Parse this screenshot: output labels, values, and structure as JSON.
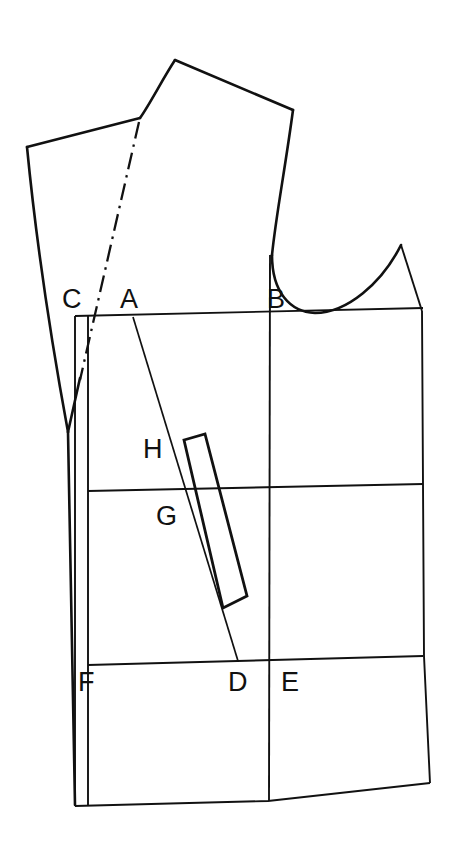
{
  "diagram": {
    "type": "technical-line-drawing",
    "background_color": "#ffffff",
    "line_color": "#111111",
    "canvas": {
      "width": 458,
      "height": 843
    },
    "labels": [
      {
        "id": "C",
        "text": "C",
        "x": 62,
        "y": 308,
        "meaning": "center-back-neck-point"
      },
      {
        "id": "A",
        "text": "A",
        "x": 120,
        "y": 308,
        "meaning": "shoulder-dart-apex-point"
      },
      {
        "id": "B",
        "text": "B",
        "x": 267,
        "y": 308,
        "meaning": "armhole-underarm-point"
      },
      {
        "id": "H",
        "text": "H",
        "x": 143,
        "y": 458,
        "meaning": "dart-upper-point"
      },
      {
        "id": "G",
        "text": "G",
        "x": 156,
        "y": 525,
        "meaning": "waist-line-point"
      },
      {
        "id": "F",
        "text": "F",
        "x": 78,
        "y": 691,
        "meaning": "center-front-hip-point"
      },
      {
        "id": "D",
        "text": "D",
        "x": 228,
        "y": 691,
        "meaning": "dart-lower-point"
      },
      {
        "id": "E",
        "text": "E",
        "x": 281,
        "y": 691,
        "meaning": "side-hip-point"
      }
    ],
    "geometry": {
      "shoulder_left_point": {
        "x": 27,
        "y": 147
      },
      "neck_apex_point": {
        "x": 175,
        "y": 60
      },
      "neck_base_point": {
        "x": 140,
        "y": 118
      },
      "shoulder_right_point": {
        "x": 293,
        "y": 110
      },
      "armhole_low_point": {
        "x": 315,
        "y": 312
      },
      "armhole_right_top": {
        "x": 401,
        "y": 245
      },
      "bust_line_y_left": 315,
      "bust_line_y_right": 310,
      "waist_line_y_left": 490,
      "waist_line_y_right": 485,
      "hip_line_y_left": 664,
      "hip_line_y_right": 656,
      "hem_line_y_left": 805,
      "hem_line_y_right": 783,
      "box_left_x": 75,
      "box_right_x": 423,
      "center_vertical_x": 268,
      "fold_vertical_x": 88,
      "side_seam_v_point": {
        "x": 68,
        "y": 432
      }
    },
    "elements": {
      "bodice_outline": "outer-bodice-silhouette",
      "grid_block": "rectangular-construction-block",
      "shoulder_dart_guide": "dash-dot-center-line",
      "bust_dart_rectangle": "slanted-rectangular-dart",
      "armhole_curve": "sleeve-cap-scye-curve",
      "center_front_line": "center-front-fold-line",
      "dart_line_a_to_d": "shoulder-to-hip-dart-line"
    }
  }
}
